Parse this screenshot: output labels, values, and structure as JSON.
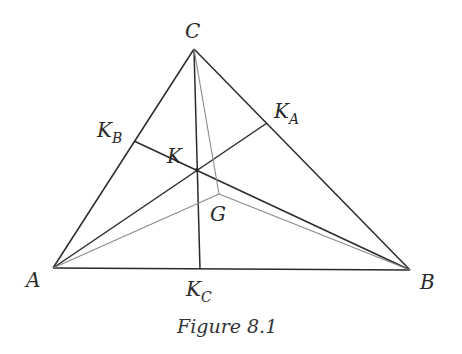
{
  "figure": {
    "caption": "Figure 8.1",
    "points": {
      "A": {
        "label": "A",
        "x": 53,
        "y": 268
      },
      "B": {
        "label": "B",
        "x": 410,
        "y": 270
      },
      "C": {
        "label": "C",
        "x": 194,
        "y": 49
      },
      "K": {
        "label": "K",
        "x": 197,
        "y": 170
      },
      "G": {
        "label": "G",
        "x": 219,
        "y": 194
      },
      "KA": {
        "label": "K",
        "sub": "A",
        "x": 267,
        "y": 123
      },
      "KB": {
        "label": "K",
        "sub": "B",
        "x": 134,
        "y": 141
      },
      "KC": {
        "label": "K",
        "sub": "C",
        "x": 200,
        "y": 269
      }
    },
    "colors": {
      "main_line": "#2a2a2a",
      "median_line": "#8a8a8a"
    }
  }
}
